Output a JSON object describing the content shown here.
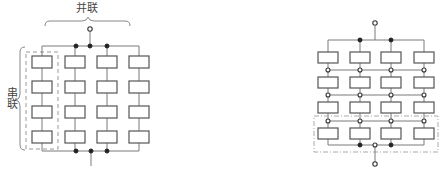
{
  "diagrams": [
    {
      "id": "left",
      "topology": "parallel-of-series",
      "labels": {
        "parallel": "并联",
        "series": "串联"
      },
      "columns": 4,
      "rows": 4
    },
    {
      "id": "right",
      "topology": "series-of-parallel",
      "columns": 4,
      "rows": 4
    }
  ],
  "colors": {
    "wire": "#7a7a7a",
    "cell_border": "#555555",
    "node_filled": "#222222",
    "text": "#444444"
  }
}
